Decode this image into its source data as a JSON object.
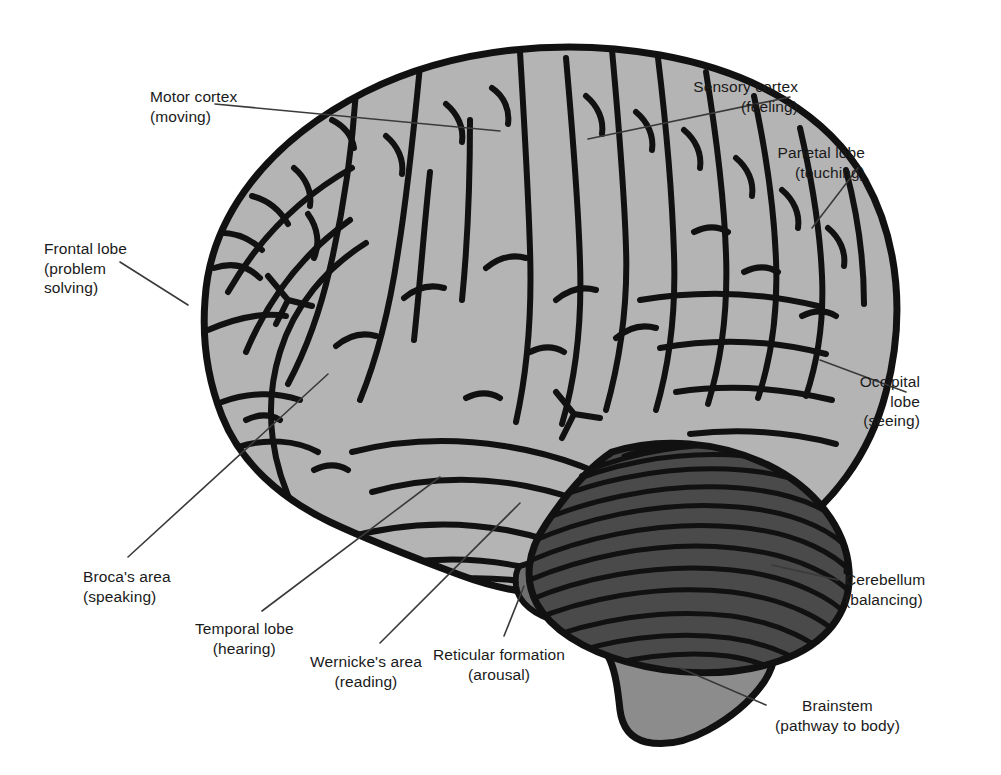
{
  "figure": {
    "background_color": "#ffffff",
    "colors": {
      "cerebrum_fill": "#b4b4b4",
      "cerebellum_fill": "#4a4a4a",
      "brainstem_fill": "#8c8c8c",
      "midbrain_fill": "#6e6e6e",
      "outline": "#111111",
      "leader_line": "#3a3a3a",
      "text": "#1a1a1a"
    }
  },
  "labels": [
    {
      "id": "motor",
      "name": "Motor cortex",
      "detail": "(moving)",
      "align": "left"
    },
    {
      "id": "sensory",
      "name": "Sensory cortex",
      "detail": "(feeling)",
      "align": "right"
    },
    {
      "id": "parietal",
      "name": "Parietal lobe",
      "detail": "(touching)",
      "align": "right"
    },
    {
      "id": "frontal",
      "name": "Frontal lobe",
      "detail": "(problem",
      "detail2": "solving)",
      "align": "left"
    },
    {
      "id": "occipital",
      "name": "Occipital",
      "detail": "lobe",
      "detail2": "(seeing)",
      "align": "right"
    },
    {
      "id": "cerebellum",
      "name": "Cerebellum",
      "detail": "(balancing)",
      "align": "left"
    },
    {
      "id": "broca",
      "name": "Broca's area",
      "detail": "(speaking)",
      "align": "left"
    },
    {
      "id": "temporal",
      "name": "Temporal lobe",
      "detail": "(hearing)",
      "align": "center"
    },
    {
      "id": "wernicke",
      "name": "Wernicke's area",
      "detail": "(reading)",
      "align": "center"
    },
    {
      "id": "reticular",
      "name": "Reticular formation",
      "detail": "(arousal)",
      "align": "center"
    },
    {
      "id": "brainstem",
      "name": "Brainstem",
      "detail": "(pathway to body)",
      "align": "center"
    }
  ]
}
